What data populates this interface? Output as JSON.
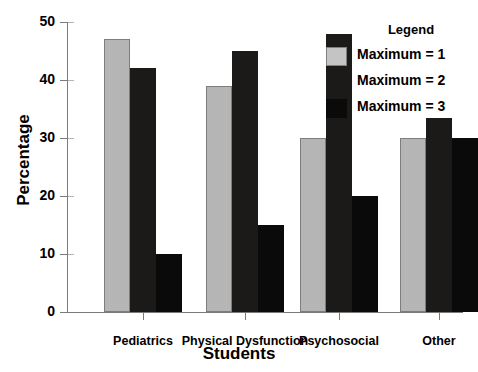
{
  "chart_data": {
    "type": "bar",
    "title": "",
    "xlabel": "Students",
    "ylabel": "Percentage",
    "categories": [
      "Pediatrics",
      "Physical Dysfunction",
      "Psychosocial",
      "Other"
    ],
    "series": [
      {
        "name": "Maximum = 1",
        "color": "#b5b5b5",
        "values": [
          47,
          39,
          30,
          30
        ]
      },
      {
        "name": "Maximum = 2",
        "color": "#1c1a19",
        "values": [
          42,
          45,
          48,
          33.5
        ]
      },
      {
        "name": "Maximum = 3",
        "color": "#0a0a0a",
        "values": [
          10,
          15,
          20,
          30
        ]
      }
    ],
    "ylim": [
      0,
      50
    ],
    "yticks": [
      0,
      10,
      20,
      30,
      40,
      50
    ],
    "yticklabels": [
      "0",
      "10",
      "20",
      "30",
      "40",
      "50"
    ],
    "grid": false,
    "legend": {
      "title": "Legend",
      "position": "top-right",
      "entries": [
        "Maximum = 1",
        "Maximum = 2",
        "Maximum = 3"
      ]
    }
  }
}
